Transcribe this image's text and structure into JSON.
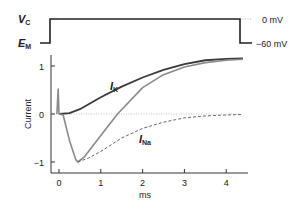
{
  "chart_data": {
    "type": "line",
    "title": "",
    "xlabel": "ms",
    "ylabel": "Current",
    "xlim": [
      -0.2,
      4.5
    ],
    "ylim": [
      -1.2,
      1.3
    ],
    "x_ticks": [
      "0",
      "1",
      "2",
      "3",
      "4"
    ],
    "y_ticks": [
      "1",
      "0",
      "−1"
    ],
    "grid": false,
    "voltage_protocol": {
      "labels": {
        "top_left": "V",
        "top_left_sub": "C",
        "bottom_left": "E",
        "bottom_left_sub": "M"
      },
      "levels": {
        "high": "0 mV",
        "low": "−60 mV"
      },
      "step_on_ms": -0.05,
      "step_off_ms": 4.4
    },
    "series": [
      {
        "name": "I_K",
        "label": "I",
        "label_sub": "K",
        "style": "solid-dark",
        "x": [
          0,
          0.25,
          0.5,
          1.0,
          1.5,
          2.0,
          2.5,
          3.0,
          3.5,
          4.0,
          4.4
        ],
        "values": [
          0,
          0.02,
          0.1,
          0.35,
          0.57,
          0.76,
          0.92,
          1.04,
          1.12,
          1.15,
          1.16
        ]
      },
      {
        "name": "I_total",
        "label": "",
        "style": "solid-gray",
        "x": [
          -0.05,
          -0.02,
          0,
          0.1,
          0.25,
          0.4,
          0.45,
          0.6,
          1.0,
          1.4,
          2.0,
          2.5,
          3.0,
          3.5,
          4.0,
          4.4
        ],
        "values": [
          0,
          0.52,
          0,
          -0.02,
          -0.55,
          -0.95,
          -1.0,
          -0.9,
          -0.45,
          0,
          0.55,
          0.82,
          0.98,
          1.07,
          1.12,
          1.14
        ]
      },
      {
        "name": "I_Na",
        "label": "I",
        "label_sub": "Na",
        "style": "dashed",
        "x": [
          0.45,
          0.7,
          1.0,
          1.5,
          2.0,
          2.5,
          3.0,
          3.5,
          4.0,
          4.4
        ],
        "values": [
          -1.0,
          -0.92,
          -0.78,
          -0.5,
          -0.3,
          -0.17,
          -0.08,
          -0.04,
          -0.02,
          -0.01
        ]
      }
    ]
  }
}
